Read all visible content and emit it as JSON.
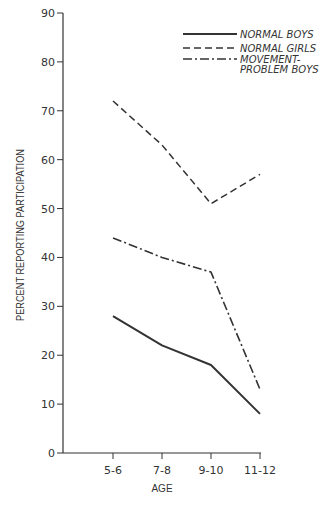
{
  "chart_data": {
    "type": "line",
    "title": "",
    "xlabel": "AGE",
    "ylabel": "PERCENT REPORTING PARTICIPATION",
    "categories": [
      "5-6",
      "7-8",
      "9-10",
      "11-12"
    ],
    "yticks": [
      0,
      10,
      20,
      30,
      40,
      50,
      60,
      70,
      80,
      90
    ],
    "ylim": [
      0,
      90
    ],
    "grid": false,
    "legend_position": "top-right",
    "series": [
      {
        "name": "NORMAL BOYS",
        "style": "solid",
        "values": [
          28,
          22,
          18,
          8
        ]
      },
      {
        "name": "NORMAL GIRLS",
        "style": "dashed",
        "values": [
          72,
          63,
          51,
          57
        ]
      },
      {
        "name": "MOVEMENT-PROBLEM BOYS",
        "style": "dash-dot",
        "values": [
          44,
          40,
          37,
          13
        ]
      }
    ]
  },
  "legend": {
    "items": [
      {
        "line1": "NORMAL BOYS",
        "line2": ""
      },
      {
        "line1": "NORMAL GIRLS",
        "line2": ""
      },
      {
        "line1": "MOVEMENT-",
        "line2": "PROBLEM BOYS"
      }
    ]
  },
  "colors": {
    "ink": "#333333",
    "background": "#ffffff"
  }
}
